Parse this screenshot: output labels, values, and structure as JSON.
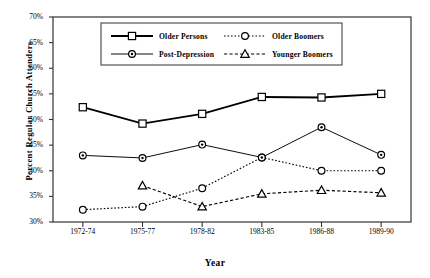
{
  "chart_data": {
    "type": "line",
    "title": "",
    "xlabel": "Year",
    "ylabel": "Percent Regular Church Attenders",
    "categories": [
      "1972-74",
      "1975-77",
      "1978-82",
      "1983-85",
      "1986-88",
      "1989-90"
    ],
    "ylim": [
      30,
      70
    ],
    "ytick_labels": [
      "30%",
      "35%",
      "40%",
      "45%",
      "50%",
      "55%",
      "60%",
      "65%",
      "70%"
    ],
    "ytick_values": [
      30,
      35,
      40,
      45,
      50,
      55,
      60,
      65,
      70
    ],
    "grid": false,
    "legend_position": "top-center",
    "series": [
      {
        "name": "Older Persons",
        "marker": "square",
        "line": "solid",
        "color": "#000000",
        "values": [
          52.4,
          49.2,
          51.1,
          54.4,
          54.3,
          55.0
        ]
      },
      {
        "name": "Older Boomers",
        "marker": "circle",
        "line": "dotted",
        "color": "#000000",
        "values": [
          32.4,
          33.0,
          36.6,
          42.6,
          40.0,
          40.0
        ]
      },
      {
        "name": "Post-Depression",
        "marker": "circle-dot",
        "line": "thin-solid",
        "color": "#000000",
        "values": [
          43.0,
          42.5,
          45.1,
          42.6,
          48.5,
          43.1
        ]
      },
      {
        "name": "Younger Boomers",
        "marker": "triangle",
        "line": "dashed",
        "color": "#000000",
        "values": [
          null,
          37.1,
          33.0,
          35.5,
          36.2,
          35.7
        ]
      }
    ]
  },
  "legend": {
    "entries": [
      {
        "label": "Older Persons"
      },
      {
        "label": "Older Boomers"
      },
      {
        "label": "Post-Depression"
      },
      {
        "label": "Younger Boomers"
      }
    ]
  }
}
